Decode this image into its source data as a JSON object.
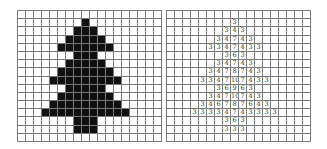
{
  "grid": {
    "rows": 16,
    "cols": 18,
    "line_color": "#7a7a7a",
    "fill_color": "#111111",
    "background": "#ffffff"
  },
  "tree_rows": [
    {
      "row": 1,
      "start": 8,
      "values": [
        "3"
      ]
    },
    {
      "row": 2,
      "start": 7,
      "values": [
        "3",
        "4",
        "3"
      ]
    },
    {
      "row": 3,
      "start": 6,
      "values": [
        "3",
        "4",
        "7",
        "4",
        "3"
      ]
    },
    {
      "row": 4,
      "start": 5,
      "values": [
        "3",
        "3",
        "4",
        "7",
        "4",
        "3",
        "3"
      ]
    },
    {
      "row": 5,
      "start": 7,
      "values": [
        "3",
        "6",
        "3"
      ]
    },
    {
      "row": 6,
      "start": 6,
      "values": [
        "3",
        "4",
        "7",
        "4",
        "3"
      ]
    },
    {
      "row": 7,
      "start": 5,
      "values": [
        "3",
        "4",
        "7",
        "8",
        "7",
        "4",
        "3"
      ]
    },
    {
      "row": 8,
      "start": 4,
      "values": [
        "3",
        "3",
        "4",
        "7",
        "10",
        "7",
        "4",
        "3",
        "3"
      ]
    },
    {
      "row": 9,
      "start": 6,
      "values": [
        "3",
        "6",
        "9",
        "6",
        "3"
      ]
    },
    {
      "row": 10,
      "start": 5,
      "values": [
        "3",
        "4",
        "7",
        "10",
        "7",
        "4",
        "3"
      ]
    },
    {
      "row": 11,
      "start": 4,
      "values": [
        "3",
        "4",
        "6",
        "7",
        "8",
        "7",
        "6",
        "4",
        "3"
      ]
    },
    {
      "row": 12,
      "start": 3,
      "values": [
        "3",
        "3",
        "3",
        "3",
        "4",
        "7",
        "4",
        "3",
        "3",
        "3",
        "3"
      ]
    },
    {
      "row": 13,
      "start": 7,
      "values": [
        "3",
        "6",
        "3"
      ]
    },
    {
      "row": 14,
      "start": 7,
      "values": [
        "3",
        "3",
        "3"
      ]
    }
  ],
  "panels": {
    "left": {
      "label": "binary-tree-silhouette"
    },
    "right": {
      "label": "numeric-distance-map"
    }
  }
}
